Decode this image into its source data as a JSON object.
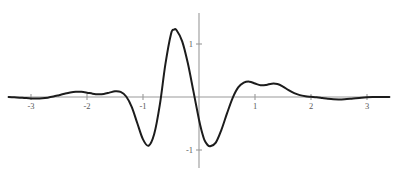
{
  "figure": {
    "background_color": "#ffffff",
    "curve_color": "#1c1c1c",
    "axis_color": "#9a9a9a",
    "label_color": "#5a5a5a",
    "width": 398,
    "height": 174
  },
  "axes": {
    "origin_px": {
      "x": 199,
      "y": 97
    },
    "x_unit_px": 56,
    "y_unit_px": 53,
    "x_axis_extent_px": {
      "from": 8,
      "to": 390
    },
    "y_axis_extent_px": {
      "from": 13,
      "to": 168
    },
    "x_tick_labels": [
      "-3",
      "-2",
      "-1",
      "1",
      "2",
      "3"
    ],
    "x_tick_values": [
      -3,
      -2,
      -1,
      1,
      2,
      3
    ],
    "y_tick_labels": [
      "1",
      "-1"
    ],
    "y_tick_values": [
      1,
      -1
    ]
  },
  "chart_data": {
    "type": "line",
    "title": "",
    "subtitle": "",
    "xlabel": "",
    "ylabel": "",
    "grid": false,
    "legend": "none",
    "xlim": [
      -3.4,
      3.4
    ],
    "ylim": [
      -1.15,
      1.45
    ],
    "xticks": [
      -3,
      -2,
      -1,
      1,
      2,
      3
    ],
    "yticks": [
      1,
      -1
    ],
    "annotations": [],
    "series": [
      {
        "name": "wavelet",
        "description": "Oscillatory decaying wavelet-like curve, single tall positive lobe left of origin, deep negative lobes either side, small ripples decaying toward +/-3",
        "x": [
          -3.4,
          -3.3,
          -3.2,
          -3.1,
          -3.0,
          -2.9,
          -2.8,
          -2.7,
          -2.6,
          -2.5,
          -2.4,
          -2.3,
          -2.2,
          -2.1,
          -2.0,
          -1.9,
          -1.8,
          -1.7,
          -1.6,
          -1.5,
          -1.4,
          -1.3,
          -1.2,
          -1.1,
          -1.0,
          -0.9,
          -0.8,
          -0.7,
          -0.6,
          -0.5,
          -0.45,
          -0.4,
          -0.3,
          -0.2,
          -0.1,
          0.0,
          0.05,
          0.1,
          0.15,
          0.2,
          0.3,
          0.4,
          0.5,
          0.6,
          0.7,
          0.8,
          0.9,
          1.0,
          1.1,
          1.2,
          1.3,
          1.4,
          1.5,
          1.6,
          1.7,
          1.8,
          1.9,
          2.0,
          2.1,
          2.2,
          2.3,
          2.4,
          2.5,
          2.6,
          2.7,
          2.8,
          2.9,
          3.0,
          3.1,
          3.2,
          3.3,
          3.4
        ],
        "y": [
          0.0,
          -0.005,
          -0.012,
          -0.02,
          -0.026,
          -0.028,
          -0.024,
          -0.012,
          0.008,
          0.034,
          0.062,
          0.086,
          0.099,
          0.097,
          0.082,
          0.063,
          0.052,
          0.058,
          0.082,
          0.108,
          0.096,
          0.01,
          -0.19,
          -0.5,
          -0.8,
          -0.92,
          -0.7,
          -0.15,
          0.62,
          1.19,
          1.27,
          1.26,
          1.05,
          0.64,
          0.11,
          -0.43,
          -0.65,
          -0.82,
          -0.9,
          -0.93,
          -0.86,
          -0.62,
          -0.31,
          -0.02,
          0.18,
          0.27,
          0.29,
          0.255,
          0.222,
          0.228,
          0.252,
          0.245,
          0.196,
          0.128,
          0.072,
          0.035,
          0.015,
          0.004,
          -0.006,
          -0.02,
          -0.034,
          -0.044,
          -0.047,
          -0.043,
          -0.034,
          -0.023,
          -0.013,
          -0.006,
          -0.002,
          0.0,
          0.001,
          0.001
        ]
      }
    ]
  }
}
